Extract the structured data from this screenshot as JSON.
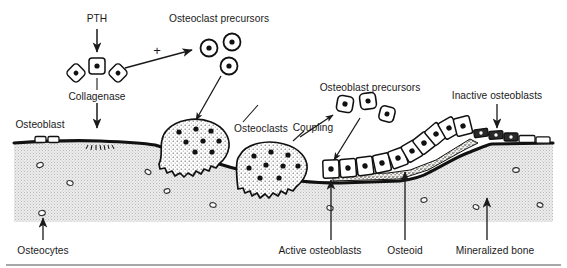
{
  "figure": {
    "type": "biological-schematic",
    "width": 567,
    "height": 268,
    "background_color": "#ffffff",
    "ink_color": "#1a1a1a",
    "bone_matrix_color": "#e3e3e3",
    "osteoid_color": "#d8d4cc"
  },
  "labels": {
    "pth": "PTH",
    "osteoclast_precursors": "Osteoclast precursors",
    "collagenase": "Collagenase",
    "osteoblast": "Osteoblast",
    "osteoclasts": "Osteoclasts",
    "osteoblast_precursors": "Osteoblast precursors",
    "coupling": "Coupling",
    "inactive_osteoblasts": "Inactive osteoblasts",
    "osteocytes": "Osteocytes",
    "active_osteoblasts": "Active osteoblasts",
    "osteoid": "Osteoid",
    "mineralized_bone": "Mineralized bone",
    "plus_sign": "+"
  },
  "cells": {
    "surface_osteoblasts": [
      {
        "x": 95,
        "y": 65
      },
      {
        "x": 115,
        "y": 72
      },
      {
        "x": 75,
        "y": 72
      }
    ],
    "osteoclast_precursors": [
      {
        "x": 209,
        "y": 48
      },
      {
        "x": 232,
        "y": 42
      },
      {
        "x": 228,
        "y": 65
      }
    ],
    "osteoblast_precursors": [
      {
        "x": 345,
        "y": 104
      },
      {
        "x": 365,
        "y": 101
      },
      {
        "x": 383,
        "y": 113
      }
    ],
    "osteoclasts": [
      {
        "x": 188,
        "y": 138,
        "nuclei": 8
      },
      {
        "x": 266,
        "y": 158,
        "nuclei": 9
      }
    ],
    "osteocyte_lacunae": [
      {
        "x": 40,
        "y": 165
      },
      {
        "x": 70,
        "y": 183
      },
      {
        "x": 42,
        "y": 213
      },
      {
        "x": 148,
        "y": 172
      },
      {
        "x": 167,
        "y": 190
      },
      {
        "x": 213,
        "y": 205
      },
      {
        "x": 100,
        "y": 232
      },
      {
        "x": 330,
        "y": 208
      },
      {
        "x": 424,
        "y": 200
      },
      {
        "x": 476,
        "y": 207
      },
      {
        "x": 516,
        "y": 170
      },
      {
        "x": 540,
        "y": 205
      },
      {
        "x": 394,
        "y": 232
      }
    ]
  },
  "arrows": {
    "pth_to_osteoblast": "downward solid arrow from PTH to osteoblast",
    "collagenase_to_surface": "downward solid arrow from collagenase to bone surface",
    "stimulation": "rightward arrow labeled plus toward osteoclast precursors",
    "precursor_to_osteoclast": "arrow from osteoclast precursors down to osteoclast",
    "osteoclasts_pointer": "leader from Osteoclasts label to osteoclast cell",
    "coupling_pointer": "arrow from Coupling toward osteoblast precursors",
    "precursor_to_osteoblast_row": "arrow from osteoblast precursors down to active osteoblast row",
    "inactive_osteoblasts_pointer": "downward arrow to inactive osteoblasts",
    "osteocytes_pointer": "upward arrow to osteocyte lacuna",
    "active_osteoblasts_pointer": "upward arrow to osteoblast row",
    "osteoid_pointer": "upward arrow to osteoid layer",
    "mineralized_bone_pointer": "upward arrow into bone matrix"
  }
}
